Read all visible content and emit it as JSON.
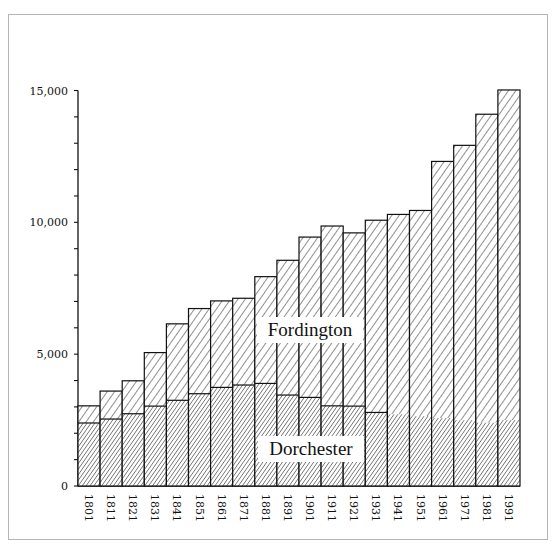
{
  "chart_data": {
    "type": "bar",
    "stacked": true,
    "title": "",
    "xlabel": "",
    "ylabel": "",
    "ylim": [
      0,
      15000
    ],
    "yticks_major": [
      0,
      5000,
      10000,
      15000
    ],
    "ytick_labels": [
      "0",
      "5,000",
      "10,000",
      "15,000"
    ],
    "yticks_minor_step": 1000,
    "grid": false,
    "legend": "inline labels",
    "categories": [
      "1801",
      "1811",
      "1821",
      "1831",
      "1841",
      "1851",
      "1861",
      "1871",
      "1881",
      "1891",
      "1901",
      "1911",
      "1921",
      "1931",
      "1941",
      "1951",
      "1961",
      "1971",
      "1981",
      "1991"
    ],
    "series": [
      {
        "name": "Dorchester",
        "pattern": "dense-hatch",
        "values": [
          2390,
          2540,
          2740,
          3030,
          3250,
          3500,
          3740,
          3830,
          3890,
          3450,
          3360,
          3040,
          3030,
          2790,
          2720,
          2650,
          2580,
          2500,
          2400,
          2500
        ]
      },
      {
        "name": "Fordington",
        "pattern": "light-hatch",
        "values": [
          650,
          1060,
          1250,
          2030,
          2900,
          3230,
          3280,
          3290,
          4050,
          5110,
          6080,
          6820,
          6570,
          7290,
          7580,
          7800,
          9730,
          10420,
          11700,
          12520
        ]
      }
    ],
    "totals": [
      3040,
      3600,
      3990,
      5060,
      6150,
      6730,
      7020,
      7120,
      7940,
      8560,
      9440,
      9860,
      9600,
      10080,
      10300,
      10450,
      12310,
      12920,
      14100,
      15020
    ],
    "annotations": [
      {
        "text": "Fordington",
        "position": "upper-middle"
      },
      {
        "text": "Dorchester",
        "position": "lower-middle"
      }
    ],
    "boundary_drawn_until": "1931"
  },
  "labels": {
    "fordington": "Fordington",
    "dorchester": "Dorchester"
  },
  "colors": {
    "line": "#111111",
    "frame": "#b5b5b5",
    "background": "#ffffff"
  }
}
